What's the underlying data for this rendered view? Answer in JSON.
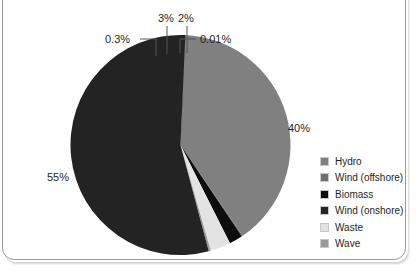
{
  "chart_data": {
    "type": "pie",
    "title": "",
    "subtitle": "",
    "xlabel": "",
    "ylabel": "",
    "legend_position": "right",
    "grid": false,
    "categories": [
      "Hydro",
      "Wind (offshore)",
      "Biomass",
      "Wind (onshore)",
      "Waste",
      "Wave"
    ],
    "values": [
      40,
      0.01,
      2,
      55,
      3,
      0.3
    ],
    "value_labels": [
      "40%",
      "0.01%",
      "2%",
      "55%",
      "3%",
      "0.3%"
    ],
    "colors": [
      "#808080",
      "#6e6e6e",
      "#0d0d0d",
      "#232323",
      "#e3e3e3",
      "#9a9a9a"
    ],
    "series": [
      {
        "name": "Share of generation",
        "values": [
          40,
          0.01,
          2,
          55,
          3,
          0.3
        ]
      }
    ],
    "slices": [
      {
        "label": "Hydro",
        "value": 40,
        "value_label": "40%",
        "color": "#808080",
        "label_placement": "outside-right"
      },
      {
        "label": "Wind (offshore)",
        "value": 0.01,
        "value_label": "0.01%",
        "color": "#6e6e6e",
        "label_placement": "leader-top-right"
      },
      {
        "label": "Biomass",
        "value": 2,
        "value_label": "2%",
        "color": "#0d0d0d",
        "label_placement": "leader-top"
      },
      {
        "label": "Wind (onshore)",
        "value": 55,
        "value_label": "55%",
        "color": "#232323",
        "label_placement": "outside-left"
      },
      {
        "label": "Waste",
        "value": 3,
        "value_label": "3%",
        "color": "#e3e3e3",
        "label_placement": "leader-top"
      },
      {
        "label": "Wave",
        "value": 0.3,
        "value_label": "0.3%",
        "color": "#9a9a9a",
        "label_placement": "leader-top-left"
      }
    ]
  },
  "labels": {
    "hydro_pct": "40%",
    "wind_onshore_pct": "55%",
    "waste_pct": "3%",
    "biomass_pct": "2%",
    "wave_pct": "0.3%",
    "wind_offshore_pct": "0.01%"
  },
  "legend": {
    "items": [
      {
        "label": "Hydro",
        "color": "#808080"
      },
      {
        "label": "Wind (offshore)",
        "color": "#6e6e6e"
      },
      {
        "label": "Biomass",
        "color": "#0d0d0d"
      },
      {
        "label": "Wind (onshore)",
        "color": "#232323"
      },
      {
        "label": "Waste",
        "color": "#e3e3e3"
      },
      {
        "label": "Wave",
        "color": "#9a9a9a"
      }
    ]
  }
}
